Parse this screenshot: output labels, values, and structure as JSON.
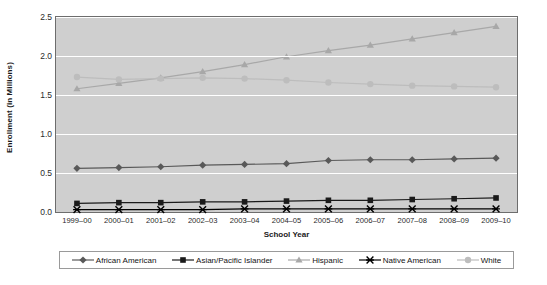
{
  "chart_data": {
    "type": "line",
    "title": "",
    "xlabel": "School Year",
    "ylabel": "Enrollment (in Millions)",
    "categories": [
      "1999–00",
      "2000–01",
      "2001–02",
      "2002–03",
      "2003–04",
      "2004–05",
      "2005–06",
      "2006–07",
      "2007–08",
      "2008–09",
      "2009–10"
    ],
    "ylim": [
      0.0,
      2.5
    ],
    "yticks": [
      "0.0",
      "0.5",
      "1.0",
      "1.5",
      "2.0",
      "2.5"
    ],
    "ytick_values": [
      0.0,
      0.5,
      1.0,
      1.5,
      2.0,
      2.5
    ],
    "grid": true,
    "legend_position": "bottom",
    "plot_background": "#cfcfcf",
    "gridline_color": "#ffffff",
    "series": [
      {
        "name": "African American",
        "marker": "diamond",
        "color": "#595959",
        "values": [
          0.56,
          0.57,
          0.58,
          0.6,
          0.61,
          0.62,
          0.66,
          0.67,
          0.67,
          0.68,
          0.69
        ]
      },
      {
        "name": "Asian/Pacific Islander",
        "marker": "square",
        "color": "#1a1a1a",
        "values": [
          0.11,
          0.12,
          0.12,
          0.13,
          0.13,
          0.14,
          0.15,
          0.15,
          0.16,
          0.17,
          0.18
        ]
      },
      {
        "name": "Hispanic",
        "marker": "triangle",
        "color": "#a8a8a8",
        "values": [
          1.58,
          1.65,
          1.72,
          1.8,
          1.89,
          1.99,
          2.07,
          2.14,
          2.22,
          2.3,
          2.38
        ]
      },
      {
        "name": "Native American",
        "marker": "cross",
        "color": "#000000",
        "values": [
          0.03,
          0.03,
          0.03,
          0.03,
          0.04,
          0.04,
          0.04,
          0.04,
          0.04,
          0.04,
          0.04
        ]
      },
      {
        "name": "White",
        "marker": "circle",
        "color": "#bdbdbd",
        "values": [
          1.73,
          1.7,
          1.71,
          1.72,
          1.71,
          1.69,
          1.66,
          1.64,
          1.62,
          1.61,
          1.6
        ]
      }
    ]
  }
}
